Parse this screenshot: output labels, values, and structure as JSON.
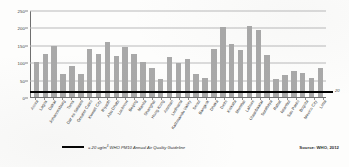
{
  "chart_data": {
    "type": "bar",
    "title": "",
    "xlabel": "",
    "ylabel": "",
    "ylim": [
      0,
      250
    ],
    "yticks": [
      0,
      50,
      100,
      150,
      200,
      250
    ],
    "grid": true,
    "legend_position": "bottom-left",
    "categories": [
      "Accra",
      "Lagos",
      "Dakar",
      "Johannesburg",
      "Tunis",
      "Dar es Salaam",
      "Greater Cairo",
      "Kuwait City",
      "Riyadh",
      "Abu Dhabi",
      "Lucknow",
      "Beijing",
      "Manila",
      "Shanghai",
      "Hong Kong",
      "Amman",
      "Ludhiana",
      "Kathmandu Valley",
      "Seoul",
      "Bangkok",
      "Dhaka",
      "Delhi",
      "Kolkata",
      "Mumbai",
      "Lahore",
      "Ulaanbaatar",
      "Surabaya",
      "Rabat",
      "Istanbul",
      "Sao Paulo",
      "Bogota",
      "Mexico City",
      "Lima"
    ],
    "values": [
      100,
      123,
      146,
      67,
      89,
      65,
      139,
      124,
      159,
      119,
      143,
      124,
      101,
      84,
      51,
      114,
      99,
      110,
      67,
      55,
      137,
      202,
      153,
      135,
      203,
      192,
      121,
      53,
      62,
      76,
      70,
      55,
      83
    ],
    "series_name": "PM10 annual mean concentration",
    "reference_line": {
      "value": 20,
      "label": "20",
      "legend_text": "= 20 ug/m³ WHO PM10 Annual Air Quality Guideline",
      "legend_prefix": "=",
      "legend_unit": "20 ug/m",
      "legend_sup": "3",
      "legend_rest": " WHO PM10 Annual Air Quality Guideline",
      "color": "#000000"
    },
    "bar_color": "#a9a9a9",
    "source": "Source: WHO, 2012"
  }
}
